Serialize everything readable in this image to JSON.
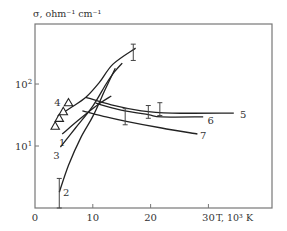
{
  "chart_data": {
    "type": "line",
    "title": "",
    "ylabel": "σ, ohm⁻¹ cm⁻¹",
    "xlabel": "T, 10³ K",
    "yscale": "log",
    "xlim": [
      0,
      41
    ],
    "ylim": [
      1,
      930
    ],
    "x_ticks": [
      {
        "value": 0,
        "label": "0"
      },
      {
        "value": 10,
        "label": "10"
      },
      {
        "value": 20,
        "label": "20"
      },
      {
        "value": 30,
        "label": "30"
      }
    ],
    "y_ticks": [
      {
        "value": 10,
        "label": "10",
        "exp": "1"
      },
      {
        "value": 100,
        "label": "10",
        "exp": "2"
      }
    ],
    "grid": false,
    "legend": "none",
    "series": [
      {
        "name": "4",
        "x": [
          3.9,
          6.1,
          8.8,
          11.1,
          13.5,
          17.4
        ],
        "y": [
          30,
          41,
          61,
          105,
          210,
          380
        ],
        "label_at": {
          "x": 3.9,
          "y": 52
        }
      },
      {
        "name": "1",
        "x": [
          4.7,
          7.9,
          11.1,
          13.2
        ],
        "y": [
          15.6,
          28,
          48,
          64
        ],
        "label_at": {
          "x": 4.7,
          "y": 11.5
        }
      },
      {
        "name": "3",
        "x": [
          4.4,
          7.0,
          10.0,
          12.3,
          13.7,
          15.1
        ],
        "y": [
          9.6,
          19.5,
          44,
          100,
          155,
          218
        ],
        "label_at": {
          "x": 3.7,
          "y": 7.2
        }
      },
      {
        "name": "2",
        "x": [
          4.2,
          5.8,
          7.9,
          10.0,
          12.1,
          13.9
        ],
        "y": [
          1.8,
          4.9,
          13.5,
          30,
          80,
          180
        ],
        "label_at": {
          "x": 5.4,
          "y": 1.8
        }
      },
      {
        "name": "5",
        "x": [
          8.8,
          13.2,
          18.4,
          23.7,
          34.4
        ],
        "y": [
          61,
          46,
          37,
          34,
          34
        ],
        "label_at": {
          "x": 36.0,
          "y": 33
        }
      },
      {
        "name": "6",
        "x": [
          10.5,
          14.9,
          19.6,
          21.9,
          29.1
        ],
        "y": [
          49,
          38,
          32,
          29.5,
          29.5
        ],
        "label_at": {
          "x": 30.4,
          "y": 26
        }
      },
      {
        "name": "7",
        "x": [
          8.2,
          12.3,
          15.8,
          21.9,
          28.1
        ],
        "y": [
          37,
          29.5,
          25,
          19.5,
          15.6
        ],
        "label_at": {
          "x": 29.1,
          "y": 15
        }
      }
    ],
    "markers": {
      "shape": "triangle-open",
      "points": [
        {
          "x": 3.5,
          "y": 21
        },
        {
          "x": 4.2,
          "y": 28
        },
        {
          "x": 4.9,
          "y": 36
        },
        {
          "x": 5.8,
          "y": 50
        }
      ]
    },
    "error_bars": [
      {
        "x": 17.0,
        "y_low": 240,
        "y_high": 440
      },
      {
        "x": 15.6,
        "y_low": 22,
        "y_high": 40
      },
      {
        "x": 19.6,
        "y_low": 28,
        "y_high": 45
      },
      {
        "x": 21.6,
        "y_low": 31,
        "y_high": 50
      },
      {
        "x": 4.2,
        "y_low": 1.0,
        "y_high": 3.0
      }
    ]
  }
}
